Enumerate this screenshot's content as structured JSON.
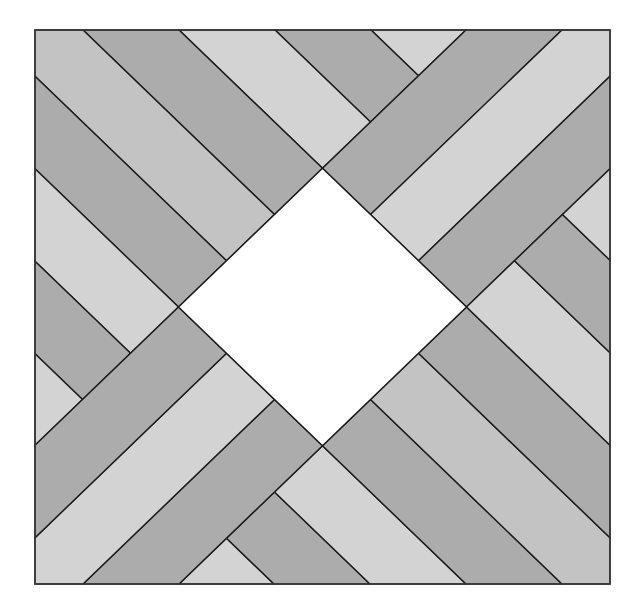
{
  "diagram": {
    "title": "",
    "frame": {
      "x": 35,
      "y": 30,
      "width": 575,
      "height": 554
    },
    "design_units": 575,
    "colors": {
      "light": "#d3d3d3",
      "medium": "#c3c3c3",
      "dark": "#acacac",
      "center": "#ffffff",
      "line": "#1a1a1a",
      "border": "#3a3a3a"
    },
    "center_diamond": {
      "name": "center-diamond",
      "shade": "center",
      "points": [
        [
          287.5,
          143.5
        ],
        [
          431.5,
          287.5
        ],
        [
          287.5,
          431.5
        ],
        [
          143.5,
          287.5
        ]
      ]
    },
    "arms": [
      {
        "name": "arm-top-left",
        "direction": "diagonal-down",
        "strips": [
          {
            "shade": "light",
            "points": [
              [
                336,
                0
              ],
              [
                431,
                0
              ],
              [
                383.5,
                47.5
              ]
            ]
          },
          {
            "shade": "dark",
            "points": [
              [
                240,
                0
              ],
              [
                336,
                0
              ],
              [
                383.5,
                47.5
              ],
              [
                335.5,
                95.5
              ]
            ]
          },
          {
            "shade": "light",
            "points": [
              [
                144,
                0
              ],
              [
                240,
                0
              ],
              [
                335.5,
                95.5
              ],
              [
                287.5,
                143.5
              ]
            ]
          },
          {
            "shade": "dark",
            "points": [
              [
                48,
                0
              ],
              [
                144,
                0
              ],
              [
                287.5,
                143.5
              ],
              [
                239.5,
                191.5
              ]
            ]
          },
          {
            "shade": "medium",
            "points": [
              [
                0,
                0
              ],
              [
                48,
                0
              ],
              [
                239.5,
                191.5
              ],
              [
                191.5,
                239.5
              ],
              [
                0,
                48
              ]
            ]
          },
          {
            "shade": "dark",
            "points": [
              [
                0,
                48
              ],
              [
                191.5,
                239.5
              ],
              [
                143.5,
                287.5
              ],
              [
                0,
                144
              ]
            ]
          },
          {
            "shade": "light",
            "points": [
              [
                0,
                144
              ],
              [
                143.5,
                287.5
              ],
              [
                95.5,
                335.5
              ],
              [
                0,
                240
              ]
            ]
          },
          {
            "shade": "dark",
            "points": [
              [
                0,
                240
              ],
              [
                95.5,
                335.5
              ],
              [
                47.5,
                383.5
              ],
              [
                0,
                336
              ]
            ]
          },
          {
            "shade": "light",
            "points": [
              [
                0,
                336
              ],
              [
                47.5,
                383.5
              ],
              [
                0,
                431
              ]
            ]
          }
        ]
      },
      {
        "name": "arm-top-right",
        "direction": "diagonal-up",
        "strips": [
          {
            "shade": "dark",
            "points": [
              [
                431,
                0
              ],
              [
                527,
                0
              ],
              [
                335.5,
                191.5
              ],
              [
                287.5,
                143.5
              ]
            ]
          },
          {
            "shade": "light",
            "points": [
              [
                527,
                0
              ],
              [
                575,
                0
              ],
              [
                575,
                48
              ],
              [
                383.5,
                239.5
              ],
              [
                335.5,
                191.5
              ]
            ]
          },
          {
            "shade": "dark",
            "points": [
              [
                575,
                48
              ],
              [
                575,
                144
              ],
              [
                431.5,
                287.5
              ],
              [
                383.5,
                239.5
              ]
            ]
          }
        ]
      },
      {
        "name": "arm-bottom-right",
        "direction": "diagonal-down",
        "strips": [
          {
            "shade": "light",
            "points": [
              [
                239,
                575
              ],
              [
                144,
                575
              ],
              [
                191.5,
                527.5
              ]
            ]
          },
          {
            "shade": "dark",
            "points": [
              [
                335,
                575
              ],
              [
                239,
                575
              ],
              [
                191.5,
                527.5
              ],
              [
                239.5,
                479.5
              ]
            ]
          },
          {
            "shade": "light",
            "points": [
              [
                431,
                575
              ],
              [
                335,
                575
              ],
              [
                239.5,
                479.5
              ],
              [
                287.5,
                431.5
              ]
            ]
          },
          {
            "shade": "dark",
            "points": [
              [
                527,
                575
              ],
              [
                431,
                575
              ],
              [
                287.5,
                431.5
              ],
              [
                335.5,
                383.5
              ]
            ]
          },
          {
            "shade": "medium",
            "points": [
              [
                575,
                575
              ],
              [
                527,
                575
              ],
              [
                335.5,
                383.5
              ],
              [
                383.5,
                335.5
              ],
              [
                575,
                527
              ]
            ]
          },
          {
            "shade": "dark",
            "points": [
              [
                575,
                527
              ],
              [
                383.5,
                335.5
              ],
              [
                431.5,
                287.5
              ],
              [
                575,
                431
              ]
            ]
          },
          {
            "shade": "light",
            "points": [
              [
                575,
                431
              ],
              [
                431.5,
                287.5
              ],
              [
                479.5,
                239.5
              ],
              [
                575,
                335
              ]
            ]
          },
          {
            "shade": "dark",
            "points": [
              [
                575,
                335
              ],
              [
                479.5,
                239.5
              ],
              [
                527.5,
                191.5
              ],
              [
                575,
                239
              ]
            ]
          },
          {
            "shade": "light",
            "points": [
              [
                575,
                239
              ],
              [
                527.5,
                191.5
              ],
              [
                575,
                144
              ]
            ]
          }
        ]
      },
      {
        "name": "arm-bottom-left",
        "direction": "diagonal-up",
        "strips": [
          {
            "shade": "dark",
            "points": [
              [
                144,
                575
              ],
              [
                48,
                575
              ],
              [
                239.5,
                383.5
              ],
              [
                287.5,
                431.5
              ]
            ]
          },
          {
            "shade": "light",
            "points": [
              [
                48,
                575
              ],
              [
                0,
                575
              ],
              [
                0,
                527
              ],
              [
                191.5,
                335.5
              ],
              [
                239.5,
                383.5
              ]
            ]
          },
          {
            "shade": "dark",
            "points": [
              [
                0,
                527
              ],
              [
                0,
                431
              ],
              [
                143.5,
                287.5
              ],
              [
                191.5,
                335.5
              ]
            ]
          }
        ]
      }
    ]
  }
}
